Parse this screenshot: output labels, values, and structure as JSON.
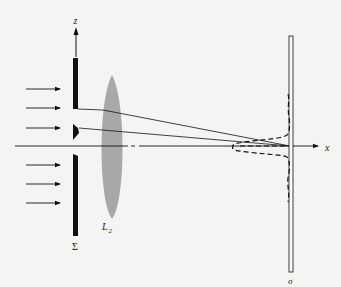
{
  "diagram": {
    "labels": {
      "z_axis": "z",
      "x_axis": "x",
      "aperture_screen": "Σ",
      "lens": "L",
      "lens_subscript": "2",
      "observation_screen": "σ"
    },
    "incident_rays_count": 6,
    "colors": {
      "ink": "#111111",
      "lens": "#a8a8a8",
      "background": "#f4f4f2"
    }
  }
}
